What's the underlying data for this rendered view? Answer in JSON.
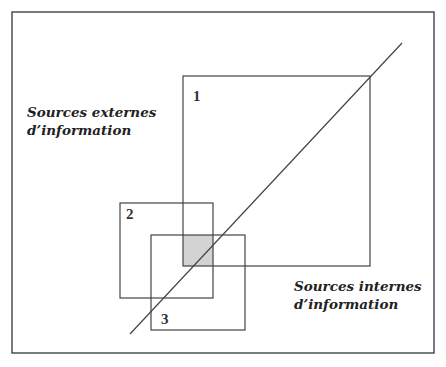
{
  "diagram": {
    "labels": {
      "external": [
        "Sources externes",
        "d’information"
      ],
      "internal": [
        "Sources internes",
        "d’information"
      ]
    },
    "boxes": [
      {
        "id": "1",
        "x": 183,
        "y": 76,
        "w": 187,
        "h": 190
      },
      {
        "id": "2",
        "x": 120,
        "y": 203,
        "w": 93,
        "h": 95
      },
      {
        "id": "3",
        "x": 151,
        "y": 235,
        "w": 94,
        "h": 95
      }
    ],
    "shaded_region": {
      "x": 183,
      "y": 235,
      "w": 30,
      "h": 31,
      "color": "#d3d3d3"
    },
    "diagonal": {
      "x1": 130,
      "y1": 334,
      "x2": 402,
      "y2": 43
    },
    "frame": {
      "x": 12,
      "y": 12,
      "w": 422,
      "h": 341
    },
    "line_color": "#444444"
  }
}
